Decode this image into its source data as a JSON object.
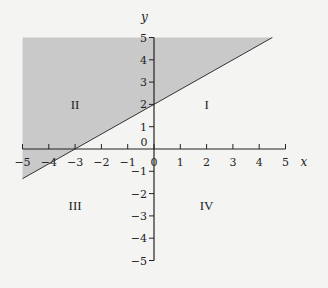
{
  "chart_data": {
    "type": "line",
    "title": "",
    "xlabel": "x",
    "ylabel": "y",
    "xlim": [
      -5,
      5
    ],
    "ylim": [
      -5,
      5
    ],
    "grid": false,
    "x_ticks": [
      -5,
      -4,
      -3,
      -2,
      -1,
      0,
      1,
      2,
      3,
      4,
      5
    ],
    "y_ticks": [
      -5,
      -4,
      -3,
      -2,
      -1,
      0,
      1,
      2,
      3,
      4,
      5
    ],
    "origin_label": "0",
    "line": {
      "equation": "y = (2/3)x + 2",
      "slope": 0.6667,
      "intercept": 2,
      "x_intercept": -3,
      "points": [
        [
          -5,
          -1.33
        ],
        [
          4.5,
          5
        ]
      ]
    },
    "shaded_region": {
      "description": "y >= (2/3)x + 2 within the window",
      "vertices": [
        [
          -5,
          -1.33
        ],
        [
          -5,
          5
        ],
        [
          4.5,
          5
        ]
      ],
      "color": "#c9c9c9"
    },
    "quadrant_labels": [
      {
        "label": "I",
        "x": 2,
        "y": 2
      },
      {
        "label": "II",
        "x": -3,
        "y": 2
      },
      {
        "label": "III",
        "x": -3,
        "y": -2.5
      },
      {
        "label": "IV",
        "x": 2,
        "y": -2.5
      }
    ]
  },
  "colors": {
    "axis": "#222222",
    "shade": "#c9c9c9",
    "background": "#f4f4f2"
  }
}
